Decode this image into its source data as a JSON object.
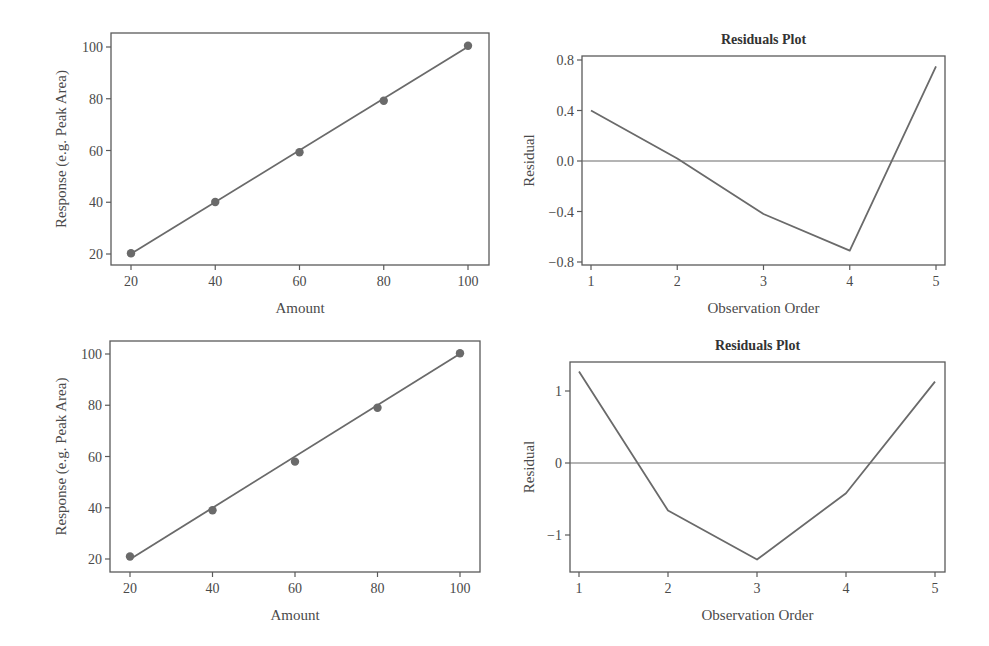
{
  "colors": {
    "line": "#6a6a6a",
    "axis": "#5a5a5a",
    "text": "#4a4a4a",
    "background": "#ffffff"
  },
  "chart_data": [
    {
      "type": "scatter",
      "panel": "top-left",
      "title": "",
      "xlabel": "Amount",
      "ylabel": "Response (e.g. Peak Area)",
      "xlim": [
        16,
        106
      ],
      "ylim": [
        16,
        106
      ],
      "xticks": [
        20,
        40,
        60,
        80,
        100
      ],
      "yticks": [
        20,
        40,
        60,
        80,
        100
      ],
      "grid": false,
      "x": [
        20,
        40,
        60,
        80,
        100
      ],
      "y": [
        20.3,
        40.1,
        59.3,
        79.2,
        100.5
      ],
      "fit_line": {
        "x": [
          20,
          100
        ],
        "y": [
          20.1,
          100.1
        ]
      }
    },
    {
      "type": "line",
      "panel": "top-right",
      "title": "Residuals Plot",
      "xlabel": "Observation Order",
      "ylabel": "Residual",
      "xlim": [
        0.9,
        5.05
      ],
      "ylim": [
        -0.82,
        0.86
      ],
      "xticks": [
        1,
        2,
        3,
        4,
        5
      ],
      "yticks": [
        -0.8,
        -0.4,
        0.0,
        0.4,
        0.8
      ],
      "ytick_labels": [
        "−0.8",
        "−0.4",
        "0.0",
        "0.4",
        "0.8"
      ],
      "reference_line": 0,
      "grid": false,
      "x": [
        1,
        2,
        3,
        4,
        5
      ],
      "y": [
        0.4,
        0.02,
        -0.42,
        -0.71,
        0.75
      ]
    },
    {
      "type": "scatter",
      "panel": "bottom-left",
      "title": "",
      "xlabel": "Amount",
      "ylabel": "Response (e.g. Peak Area)",
      "xlim": [
        16,
        107
      ],
      "ylim": [
        16,
        106
      ],
      "xticks": [
        20,
        40,
        60,
        80,
        100
      ],
      "yticks": [
        20,
        40,
        60,
        80,
        100
      ],
      "grid": false,
      "x": [
        20,
        40,
        60,
        80,
        100
      ],
      "y": [
        21.0,
        39.0,
        58.0,
        79.0,
        100.3
      ],
      "fit_line": {
        "x": [
          20,
          100
        ],
        "y": [
          19.9,
          100.1
        ]
      }
    },
    {
      "type": "line",
      "panel": "bottom-right",
      "title": "Residuals Plot",
      "xlabel": "Observation Order",
      "ylabel": "Residual",
      "xlim": [
        0.9,
        5.1
      ],
      "ylim": [
        -1.5,
        1.5
      ],
      "xticks": [
        1,
        2,
        3,
        4,
        5
      ],
      "yticks": [
        -1,
        0,
        1
      ],
      "ytick_labels": [
        "−1",
        "0",
        "1"
      ],
      "reference_line": 0,
      "grid": false,
      "x": [
        1,
        2,
        3,
        4,
        5
      ],
      "y": [
        1.27,
        -0.66,
        -1.34,
        -0.42,
        1.13
      ]
    }
  ],
  "layout": [
    {
      "left": 111,
      "top": 33,
      "right": 489,
      "bottom": 265,
      "x0": 20,
      "px0": 131,
      "x1": 100,
      "px1": 468,
      "y0": 20,
      "py0": 254,
      "y1": 100,
      "py1": 47,
      "titleY": 0,
      "ylabelX": 66
    },
    {
      "left": 582,
      "top": 56,
      "right": 945,
      "bottom": 265,
      "x0": 1,
      "px0": 591,
      "x1": 5,
      "px1": 936,
      "y0": -0.8,
      "py0": 262,
      "y1": 0.8,
      "py1": 60,
      "titleY": 44,
      "ylabelX": 534
    },
    {
      "left": 110,
      "top": 341,
      "right": 480,
      "bottom": 572,
      "x0": 20,
      "px0": 130,
      "x1": 100,
      "px1": 460,
      "y0": 20,
      "py0": 559,
      "y1": 100,
      "py1": 354,
      "titleY": 0,
      "ylabelX": 66
    },
    {
      "left": 570,
      "top": 362,
      "right": 945,
      "bottom": 572,
      "x0": 1,
      "px0": 579,
      "x1": 5,
      "px1": 935,
      "y0": -1,
      "py0": 535,
      "y1": 1,
      "py1": 391,
      "titleY": 350,
      "ylabelX": 534
    }
  ]
}
